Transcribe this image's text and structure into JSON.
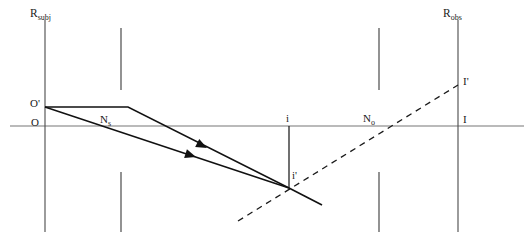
{
  "figure": {
    "background_color": "#ffffff",
    "line_color": "#111111",
    "axis_color": "#777777",
    "label_color": "#1a1a1a",
    "width": 530,
    "height": 247
  },
  "axes": {
    "optical_axis": {
      "name": "optical-axis",
      "y": 126,
      "x_start": 10,
      "x_end": 524,
      "color": "#777777"
    },
    "subject_plane": {
      "name": "R_subj",
      "label_main": "R",
      "label_sub": "subj",
      "x": 45,
      "y_top": 20,
      "y_bottom": 232,
      "label_x": 30,
      "label_y": 8
    },
    "observer_plane": {
      "name": "R_obs",
      "label_main": "R",
      "label_sub": "obs",
      "x": 458,
      "y_top": 20,
      "y_bottom": 232,
      "label_x": 443,
      "label_y": 8
    }
  },
  "apertures": [
    {
      "name": "aperture-left-upper",
      "x": 121,
      "y_top": 28,
      "y_bottom": 90
    },
    {
      "name": "aperture-left-lower",
      "x": 121,
      "y_top": 172,
      "y_bottom": 232
    },
    {
      "name": "aperture-right-upper",
      "x": 379,
      "y_top": 28,
      "y_bottom": 90
    },
    {
      "name": "aperture-right-lower",
      "x": 379,
      "y_top": 172,
      "y_bottom": 232
    }
  ],
  "points": [
    {
      "name": "object-prime",
      "label": "O'",
      "x": 45,
      "y": 107,
      "label_x": 30,
      "label_y": 98
    },
    {
      "name": "object",
      "label": "O",
      "x": 45,
      "y": 126,
      "label_x": 31,
      "label_y": 117
    },
    {
      "name": "nodal-subject",
      "label_main": "N",
      "label_sub": "s",
      "x": 107,
      "y": 126,
      "label_x": 100,
      "label_y": 114
    },
    {
      "name": "intermediate-axis-point",
      "label": "i",
      "x": 289,
      "y": 126,
      "label_x": 286,
      "label_y": 113
    },
    {
      "name": "intermediate-image-point",
      "label": "i'",
      "x": 289,
      "y": 188,
      "label_x": 292,
      "label_y": 170
    },
    {
      "name": "nodal-observer",
      "label_main": "N",
      "label_sub": "o",
      "x": 372,
      "y": 126,
      "label_x": 363,
      "label_y": 113
    },
    {
      "name": "image-prime",
      "label": "I'",
      "x": 458,
      "y": 85,
      "label_x": 463,
      "label_y": 76
    },
    {
      "name": "image",
      "label": "I",
      "x": 458,
      "y": 126,
      "label_x": 463,
      "label_y": 114
    }
  ],
  "rays": {
    "upper_ray": {
      "name": "upper-ray-from-object-prime",
      "style": "solid",
      "points": "45,107 128,107 289,188",
      "arrow": {
        "x": 207,
        "y": 148,
        "angle": 27
      }
    },
    "lower_ray": {
      "name": "lower-ray-from-object-prime",
      "style": "solid",
      "points": "45,107 289,188",
      "arrow": {
        "x": 196,
        "y": 157,
        "angle": 18
      }
    },
    "exit_ray": {
      "name": "exit-ray-to-lower-right",
      "style": "solid",
      "points": "289,188 322,205"
    },
    "virtual_ray": {
      "name": "virtual-image-ray-dashed",
      "style": "dashed",
      "points": "238,221 458,85",
      "dash_pattern": "6 5"
    }
  },
  "verticals": {
    "intermediate_drop": {
      "name": "intermediate-image-vertical",
      "x": 289,
      "y_top": 126,
      "y_bottom": 188
    }
  }
}
